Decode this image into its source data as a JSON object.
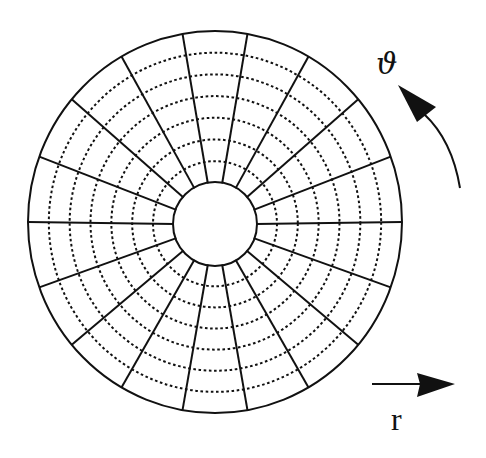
{
  "diagram": {
    "grid": {
      "radial_line_count": 18,
      "radial_angle_step_deg": 20,
      "radial_start_angle_deg": 0,
      "dashed_circle_count": 6,
      "inner_to_outer_radius_ratio": 0.22
    },
    "labels": {
      "theta": "ϑ",
      "r": "r"
    },
    "arrows": {
      "theta_direction": "counter-clockwise",
      "r_direction": "right"
    },
    "colors": {
      "ink": "#111111",
      "background": "#ffffff"
    }
  }
}
